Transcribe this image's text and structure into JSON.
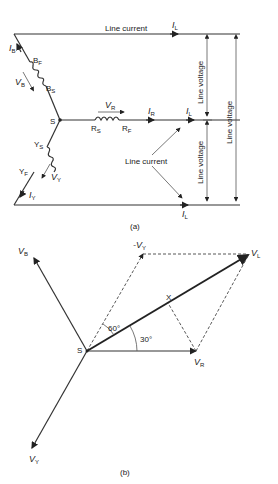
{
  "figure": {
    "part_a": {
      "caption": "(a)",
      "star_point": "S",
      "line_current_top": "Line current",
      "line_current_mid": "Line current",
      "line_voltage_labels": [
        "Line voltage",
        "Line voltage",
        "Line voltage"
      ],
      "phases": {
        "B": {
          "current": "I",
          "current_sub": "B",
          "voltage": "V",
          "voltage_sub": "B",
          "finish": "B",
          "finish_sub": "F",
          "start": "B",
          "start_sub": "S"
        },
        "R": {
          "current": "I",
          "current_sub": "R",
          "voltage": "V",
          "voltage_sub": "R",
          "start": "R",
          "start_sub": "S",
          "finish": "R",
          "finish_sub": "F"
        },
        "Y": {
          "current": "I",
          "current_sub": "Y",
          "voltage": "V",
          "voltage_sub": "Y",
          "start": "Y",
          "start_sub": "S",
          "finish": "Y",
          "finish_sub": "F"
        }
      },
      "line_currents": {
        "symbol": "I",
        "sub": "L"
      }
    },
    "part_b": {
      "caption": "(b)",
      "origin": "S",
      "vectors": {
        "VB": {
          "sym": "V",
          "sub": "B"
        },
        "VY": {
          "sym": "V",
          "sub": "Y"
        },
        "VR": {
          "sym": "V",
          "sub": "R"
        },
        "VL": {
          "sym": "V",
          "sub": "L"
        },
        "negVY": {
          "sym": "-V",
          "sub": "Y"
        }
      },
      "angle_60": "60°",
      "angle_30": "30°",
      "point_x": "X"
    }
  }
}
